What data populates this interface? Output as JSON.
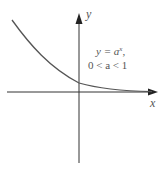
{
  "diagram": {
    "type": "function-graph",
    "function": "y = a^x, 0 < a < 1",
    "axes": {
      "x_label": "x",
      "y_label": "y"
    },
    "annotation": {
      "line1_prefix": "y = a",
      "line1_exp": "x",
      "line1_suffix": ",",
      "line2": "0 < a < 1"
    },
    "colors": {
      "axis": "#333333",
      "curve": "#555555",
      "text": "#555555"
    }
  }
}
